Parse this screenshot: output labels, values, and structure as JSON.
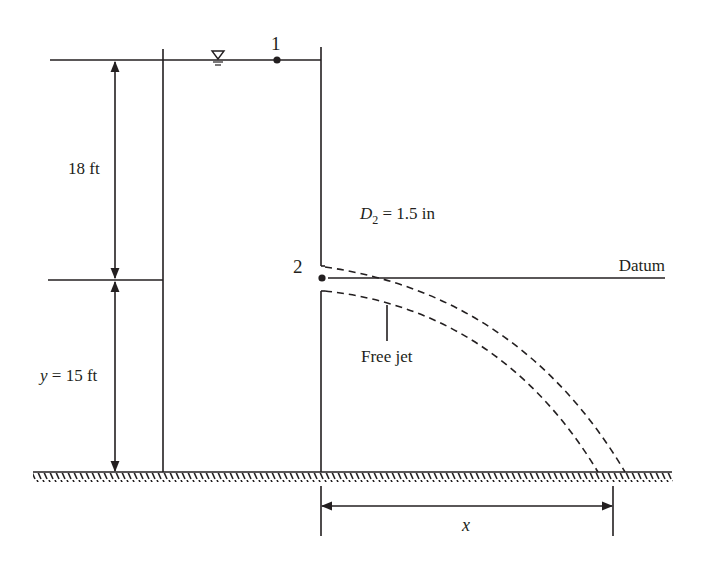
{
  "diagram": {
    "point_1_label": "1",
    "point_2_label": "2",
    "height_above_label": "18 ft",
    "height_below_prefix": "y",
    "height_below_label": " = 15 ft",
    "diameter_symbol": "D",
    "diameter_subscript": "2",
    "diameter_value": " = 1.5 in",
    "datum_label": "Datum",
    "free_jet_label": "Free jet",
    "horizontal_distance_label": "x",
    "free_surface_icon": "water-surface-triangle",
    "colors": {
      "ink": "#231f20",
      "background": "#ffffff"
    }
  }
}
